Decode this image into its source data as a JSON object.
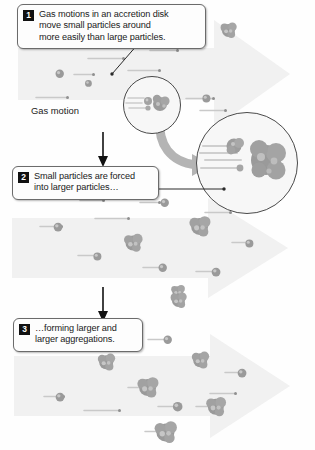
{
  "figure": {
    "background_color": "#fefefe",
    "arrow_fill": "#f0f0f0",
    "particle_color": "#9a9a9a",
    "streak_color": "#c9c9c9"
  },
  "steps": [
    {
      "number": "1",
      "text": "Gas motions in an accretion disk\nmove small particles around\nmore easily than large particles."
    },
    {
      "number": "2",
      "text": "Small particles are forced\ninto larger particles…"
    },
    {
      "number": "3",
      "text": "…forming larger and\nlarger aggregations."
    }
  ],
  "labels": {
    "gas_motion": "Gas motion"
  },
  "insets": {
    "small": {
      "name": "small-detail-circle"
    },
    "large": {
      "name": "magnified-detail-circle"
    }
  },
  "panels": {
    "panel1": {
      "name": "panel-gas-motion",
      "particles": [
        {
          "x": 228,
          "y": 30,
          "r": 6.5,
          "type": "clump"
        },
        {
          "x": 60,
          "y": 74,
          "r": 4.2,
          "type": "small"
        },
        {
          "x": 88,
          "y": 83,
          "r": 3.4,
          "type": "small"
        },
        {
          "x": 206,
          "y": 98,
          "r": 4.0,
          "type": "small"
        },
        {
          "x": 152,
          "y": 96,
          "r": 6.0,
          "type": "clump"
        }
      ],
      "streaks": [
        {
          "x": 88,
          "y": 58,
          "len": 34
        },
        {
          "x": 150,
          "y": 50,
          "len": 26
        },
        {
          "x": 128,
          "y": 70,
          "len": 30
        },
        {
          "x": 36,
          "y": 97,
          "len": 30
        },
        {
          "x": 74,
          "y": 74,
          "len": 18
        },
        {
          "x": 186,
          "y": 98,
          "len": 26
        },
        {
          "x": 200,
          "y": 110,
          "len": 24
        }
      ]
    },
    "panel2": {
      "name": "panel-forced-together",
      "particles": [
        {
          "x": 165,
          "y": 203,
          "r": 4.2,
          "type": "small"
        },
        {
          "x": 58,
          "y": 227,
          "r": 4.4,
          "type": "small"
        },
        {
          "x": 200,
          "y": 227,
          "r": 8.5,
          "type": "clump"
        },
        {
          "x": 133,
          "y": 243,
          "r": 7.5,
          "type": "clump"
        },
        {
          "x": 97,
          "y": 256,
          "r": 4.0,
          "type": "small"
        },
        {
          "x": 163,
          "y": 268,
          "r": 4.2,
          "type": "small"
        },
        {
          "x": 249,
          "y": 243,
          "r": 4.0,
          "type": "small"
        },
        {
          "x": 216,
          "y": 272,
          "r": 4.4,
          "type": "small"
        },
        {
          "x": 178,
          "y": 292,
          "r": 5.5,
          "type": "clump"
        }
      ],
      "streaks": [
        {
          "x": 80,
          "y": 200,
          "len": 22
        },
        {
          "x": 140,
          "y": 202,
          "len": 18
        },
        {
          "x": 95,
          "y": 218,
          "len": 32
        },
        {
          "x": 40,
          "y": 226,
          "len": 20
        },
        {
          "x": 205,
          "y": 212,
          "len": 24
        },
        {
          "x": 78,
          "y": 255,
          "len": 20
        },
        {
          "x": 143,
          "y": 267,
          "len": 20
        },
        {
          "x": 232,
          "y": 242,
          "len": 18
        },
        {
          "x": 196,
          "y": 271,
          "len": 20
        }
      ]
    },
    "panel3": {
      "name": "panel-aggregations",
      "particles": [
        {
          "x": 178,
          "y": 300,
          "r": 6.5,
          "type": "clump"
        },
        {
          "x": 106,
          "y": 362,
          "r": 7.0,
          "type": "clump"
        },
        {
          "x": 200,
          "y": 360,
          "r": 7.0,
          "type": "clump"
        },
        {
          "x": 242,
          "y": 373,
          "r": 4.4,
          "type": "small"
        },
        {
          "x": 148,
          "y": 388,
          "r": 8.5,
          "type": "clump"
        },
        {
          "x": 60,
          "y": 397,
          "r": 4.4,
          "type": "small"
        },
        {
          "x": 178,
          "y": 407,
          "r": 4.8,
          "type": "small"
        },
        {
          "x": 216,
          "y": 407,
          "r": 8.0,
          "type": "clump"
        },
        {
          "x": 165,
          "y": 432,
          "r": 9.0,
          "type": "clump"
        },
        {
          "x": 168,
          "y": 340,
          "r": 4.2,
          "type": "small"
        }
      ],
      "streaks": [
        {
          "x": 44,
          "y": 396,
          "len": 18
        },
        {
          "x": 84,
          "y": 410,
          "len": 34
        },
        {
          "x": 128,
          "y": 387,
          "len": 22
        },
        {
          "x": 158,
          "y": 406,
          "len": 18
        },
        {
          "x": 196,
          "y": 406,
          "len": 20
        },
        {
          "x": 148,
          "y": 339,
          "len": 16
        },
        {
          "x": 225,
          "y": 372,
          "len": 16
        },
        {
          "x": 210,
          "y": 393,
          "len": 24
        },
        {
          "x": 145,
          "y": 431,
          "len": 20
        }
      ]
    }
  }
}
